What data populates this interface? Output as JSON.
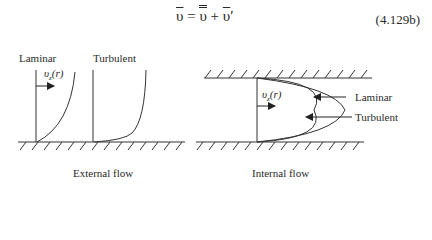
{
  "equation": {
    "text": "ῡ = ῡ̄ + ῡ′",
    "number": "(4.129b)"
  },
  "external_flow": {
    "caption": "External flow",
    "laminar_label": "Laminar",
    "turbulent_label": "Turbulent",
    "velocity_label": "υz(r)"
  },
  "internal_flow": {
    "caption": "Internal flow",
    "laminar_label": "Laminar",
    "turbulent_label": "Turbulent",
    "velocity_label": "υz(r)"
  }
}
